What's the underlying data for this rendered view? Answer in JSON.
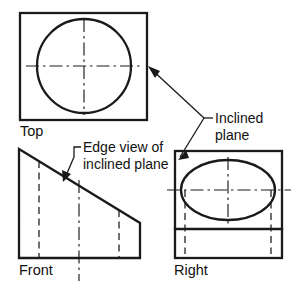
{
  "drawing": {
    "title": "Orthographic projection of an object with an inclined plane",
    "background_color": "#ffffff",
    "line_color": "#1a1a1a",
    "width": 305,
    "height": 288,
    "views": [
      {
        "id": "top",
        "label": "Top",
        "label_x": 20,
        "label_y": 136,
        "shape": "rectangle-with-circle",
        "rect": {
          "x": 20,
          "y": 13,
          "w": 127,
          "h": 107
        },
        "circle": {
          "cx": 84,
          "cy": 66,
          "r": 47
        },
        "centerline_h": {
          "x1": 26,
          "y1": 66,
          "x2": 142,
          "y2": 66
        },
        "centerline_v": {
          "x1": 84,
          "y1": 19,
          "x2": 84,
          "y2": 115
        }
      },
      {
        "id": "front",
        "label": "Front",
        "label_x": 19,
        "label_y": 275,
        "shape": "trapezoid-with-hidden-lines",
        "outline": "19,149 140,223 140,258 19,258",
        "hidden_lines": [
          {
            "x1": 39,
            "y1": 161,
            "x2": 39,
            "y2": 258
          },
          {
            "x1": 119,
            "y1": 210,
            "x2": 119,
            "y2": 258
          }
        ],
        "centerline_v": {
          "x1": 79,
          "y1": 180,
          "x2": 79,
          "y2": 280
        }
      },
      {
        "id": "right",
        "label": "Right",
        "label_x": 174,
        "label_y": 275,
        "shape": "rectangle-with-ellipse",
        "rect": {
          "x": 175,
          "y": 151,
          "w": 107,
          "h": 107
        },
        "ellipse": {
          "cx": 228,
          "cy": 190,
          "rx": 47,
          "ry": 30
        },
        "divider_line": {
          "x1": 175,
          "y1": 229,
          "x2": 282,
          "y2": 229
        },
        "centerline_h": {
          "x1": 167,
          "y1": 190,
          "x2": 291,
          "y2": 190
        },
        "centerline_v": {
          "x1": 228,
          "y1": 157,
          "x2": 228,
          "y2": 224
        },
        "hidden_lines": [
          {
            "x1": 185,
            "y1": 190,
            "x2": 185,
            "y2": 254
          },
          {
            "x1": 271,
            "y1": 190,
            "x2": 271,
            "y2": 254
          }
        ]
      }
    ],
    "annotations": [
      {
        "id": "inclined-plane",
        "text_line1": "Inclined",
        "text_line2": "plane",
        "text_x": 215,
        "text_y1": 123,
        "text_y2": 140,
        "leader_horizontal": {
          "x1": 205,
          "y1": 118,
          "x2": 213,
          "y2": 118
        },
        "leaders": [
          {
            "from_x": 205,
            "from_y": 118,
            "to_x": 148,
            "to_y": 66
          },
          {
            "from_x": 205,
            "from_y": 118,
            "to_x": 181,
            "to_y": 158
          }
        ]
      },
      {
        "id": "edge-view-of-inclined-plane",
        "text_line1": "Edge view of",
        "text_line2": "inclined plane",
        "text_x": 82,
        "text_y1": 152,
        "text_y2": 168,
        "leader_corner": {
          "x1": 80,
          "y1": 147,
          "x2": 73,
          "y2": 147,
          "x3": 73,
          "y3": 158
        },
        "leader_to": {
          "from_x": 73,
          "from_y": 158,
          "to_x": 63,
          "to_y": 180
        }
      }
    ]
  }
}
